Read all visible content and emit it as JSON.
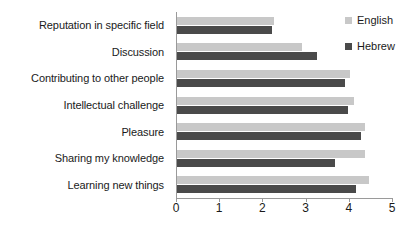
{
  "chart_data": {
    "type": "bar",
    "orientation": "horizontal",
    "title": "",
    "xlabel": "",
    "ylabel": "",
    "xlim": [
      0,
      5
    ],
    "grid": false,
    "legend_position": "top-right",
    "xticks": [
      "0",
      "1",
      "2",
      "3",
      "4",
      "5"
    ],
    "categories": [
      "Reputation in specific field",
      "Discussion",
      "Contributing to other people",
      "Intellectual challenge",
      "Pleasure",
      "Sharing my knowledge",
      "Learning new things"
    ],
    "series": [
      {
        "name": "English",
        "color": "#c8c8c8",
        "values": [
          2.25,
          2.9,
          4.0,
          4.1,
          4.35,
          4.35,
          4.45
        ]
      },
      {
        "name": "Hebrew",
        "color": "#4a4a4a",
        "values": [
          2.2,
          3.25,
          3.9,
          3.95,
          4.25,
          3.65,
          4.15
        ]
      }
    ]
  },
  "legend": {
    "items": [
      {
        "label": "English",
        "swatch": "legend-swatch-english"
      },
      {
        "label": "Hebrew",
        "swatch": "legend-swatch-hebrew"
      }
    ]
  }
}
